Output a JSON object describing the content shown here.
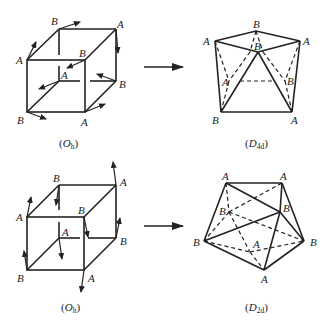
{
  "panels": [
    {
      "id": "top-left",
      "caption_main": "O",
      "caption_sub": "h",
      "labels": {
        "front_tl": "A",
        "front_tr": "B",
        "front_bl": "B",
        "front_br": "A",
        "back_tl": "B",
        "back_tr": "A",
        "back_br": "B",
        "back_bl": "A"
      }
    },
    {
      "id": "top-right",
      "caption_main": "D",
      "caption_sub": "4d",
      "labels": {
        "top_left": "A",
        "top": "B",
        "top_right": "A",
        "mid": "B",
        "bottom_left": "B",
        "bottom_right": "A",
        "inner_left": "A",
        "inner_right": "B"
      }
    },
    {
      "id": "bottom-left",
      "caption_main": "O",
      "caption_sub": "h",
      "labels": {
        "front_tl": "A",
        "front_tr": "B",
        "front_bl": "B",
        "front_br": "A",
        "back_tl": "B",
        "back_tr": "A",
        "back_br": "B",
        "back_bl": "A"
      }
    },
    {
      "id": "bottom-right",
      "caption_main": "D",
      "caption_sub": "2d",
      "labels": {
        "top_left": "A",
        "top_right": "A",
        "right_mid": "B",
        "inner_b": "B",
        "left": "B",
        "right": "B",
        "inner_a": "A",
        "bottom": "A"
      }
    }
  ],
  "transitions": [
    {
      "from": "Oh",
      "to": "D4d"
    },
    {
      "from": "Oh",
      "to": "D2d"
    }
  ]
}
